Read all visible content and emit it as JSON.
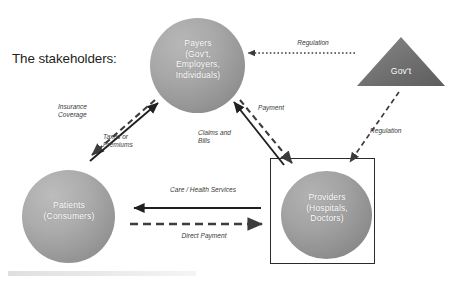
{
  "title": "The stakeholders:",
  "nodes": [
    {
      "id": "payers",
      "label": "Payers\n(Gov't,\nEmployers,\nIndividuals)",
      "shape": "circle",
      "fill": "#a0a0a0",
      "text_color": "#ffffff"
    },
    {
      "id": "patients",
      "label": "Patients\n(Consumers)",
      "shape": "circle",
      "fill": "#a5a5a5",
      "text_color": "#ffffff"
    },
    {
      "id": "providers",
      "label": "Providers\n(Hospitals,\nDoctors)",
      "shape": "circle-in-box",
      "fill": "#9c9c9c",
      "box_border": "#2b2b2b",
      "text_color": "#ffffff"
    },
    {
      "id": "government",
      "label": "Gov't",
      "shape": "triangle",
      "fill": "#6f6f6f",
      "text_color": "#ffffff"
    }
  ],
  "edges": [
    {
      "id": "insurance-coverage",
      "label": "Insurance\nCoverage",
      "from": "payers",
      "to": "patients",
      "style": "dashed",
      "direction": "down-left"
    },
    {
      "id": "taxes-or-premiums",
      "label": "Taxes or\nPremiums",
      "from": "patients",
      "to": "payers",
      "style": "solid",
      "direction": "up-right"
    },
    {
      "id": "claims-and-bills",
      "label": "Claims and\nBills",
      "from": "providers",
      "to": "payers",
      "style": "solid",
      "direction": "up-left"
    },
    {
      "id": "payment",
      "label": "Payment",
      "from": "payers",
      "to": "providers",
      "style": "dashed",
      "direction": "down-right"
    },
    {
      "id": "care-health-services",
      "label": "Care / Health Services",
      "from": "providers",
      "to": "patients",
      "style": "solid",
      "direction": "left"
    },
    {
      "id": "direct-payment",
      "label": "Direct Payment",
      "from": "patients",
      "to": "providers",
      "style": "dashed",
      "direction": "right"
    },
    {
      "id": "regulation-payers",
      "label": "Regulation",
      "from": "government",
      "to": "payers",
      "style": "dotted",
      "direction": "left"
    },
    {
      "id": "regulation-providers",
      "label": "Regulation",
      "from": "government",
      "to": "providers",
      "style": "dashed",
      "direction": "down-left"
    }
  ],
  "colors": {
    "background": "#ffffff",
    "node_gray": "#a0a0a0",
    "triangle_gray": "#6f6f6f",
    "line_black": "#231f20",
    "label_text": "#3a3a3a",
    "node_text": "#ffffff"
  }
}
